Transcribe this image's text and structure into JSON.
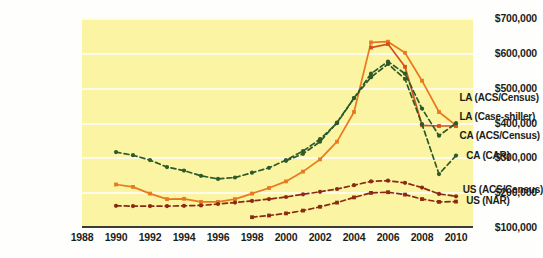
{
  "chart_data": {
    "type": "line",
    "title": "",
    "xlabel": "",
    "ylabel": "",
    "xlim": [
      1988,
      2011
    ],
    "ylim": [
      100000,
      700000
    ],
    "grid": true,
    "legend_position": "inline-right",
    "x_ticks": [
      "1988",
      "1990",
      "1992",
      "1994",
      "1996",
      "1998",
      "2000",
      "2002",
      "2004",
      "2006",
      "2008",
      "2010"
    ],
    "y_ticks": [
      "$100,000",
      "$200,000",
      "$300,000",
      "$400,000",
      "$500,000",
      "$600,000",
      "$700,000"
    ],
    "y_tick_values": [
      100000,
      200000,
      300000,
      400000,
      500000,
      600000,
      700000
    ],
    "plot_background": "#faf4a3",
    "gridline_color": "#fdfcef",
    "axis_color": "#3b3b35",
    "series": [
      {
        "name": "LA (ACS/Census)",
        "color": "#e8791e",
        "style": "solid",
        "marker": "square",
        "x": [
          1990,
          1991,
          1992,
          1993,
          1994,
          1995,
          1996,
          1997,
          1998,
          1999,
          2000,
          2001,
          2002,
          2003,
          2004,
          2005,
          2006,
          2007,
          2008,
          2009,
          2010
        ],
        "y": [
          222000,
          215000,
          196000,
          180000,
          181000,
          172000,
          172000,
          180000,
          196000,
          212000,
          231000,
          259000,
          294000,
          345000,
          430000,
          630000,
          632000,
          600000,
          520000,
          430000,
          392000
        ]
      },
      {
        "name": "LA (Case-shiller)",
        "color": "#d4511a",
        "style": "solid",
        "marker": "square",
        "x": [
          2005,
          2006,
          2007,
          2008,
          2009,
          2010
        ],
        "y": [
          615000,
          625000,
          560000,
          392000,
          390000,
          390000
        ]
      },
      {
        "name": "CA (ACS/Census)",
        "color": "#2d5a2a",
        "style": "dashed",
        "marker": "diamond",
        "x": [
          1990,
          1991,
          1992,
          1993,
          1994,
          1995,
          1996,
          1997,
          1998,
          1999,
          2000,
          2001,
          2002,
          2003,
          2004,
          2005,
          2006,
          2007,
          2008,
          2009,
          2010
        ],
        "y": [
          315000,
          306000,
          292000,
          272000,
          262000,
          247000,
          238000,
          242000,
          256000,
          270000,
          292000,
          318000,
          352000,
          398000,
          470000,
          540000,
          575000,
          540000,
          440000,
          362000,
          398000
        ]
      },
      {
        "name": "CA (CAR)",
        "color": "#2d5a2a",
        "style": "dashed",
        "marker": "diamond",
        "x": [
          2000,
          2001,
          2002,
          2003,
          2004,
          2005,
          2006,
          2007,
          2008,
          2009,
          2010
        ],
        "y": [
          290000,
          310000,
          345000,
          400000,
          470000,
          530000,
          568000,
          525000,
          395000,
          252000,
          305000
        ]
      },
      {
        "name": "US (ACS/Census)",
        "color": "#8a2a12",
        "style": "dashed",
        "marker": "diamond",
        "x": [
          1990,
          1991,
          1992,
          1993,
          1994,
          1995,
          1996,
          1997,
          1998,
          1999,
          2000,
          2001,
          2002,
          2003,
          2004,
          2005,
          2006,
          2007,
          2008,
          2009,
          2010
        ],
        "y": [
          161000,
          160000,
          160000,
          160000,
          161000,
          162000,
          166000,
          170000,
          175000,
          180000,
          186000,
          194000,
          201000,
          209000,
          220000,
          231000,
          233000,
          227000,
          213000,
          195000,
          188000
        ]
      },
      {
        "name": "US (NAR)",
        "color": "#8a2a12",
        "style": "dashed",
        "marker": "square",
        "x": [
          1998,
          1999,
          2000,
          2001,
          2002,
          2003,
          2004,
          2005,
          2006,
          2007,
          2008,
          2009,
          2010
        ],
        "y": [
          128000,
          133000,
          139000,
          147000,
          158000,
          170000,
          185000,
          198000,
          200000,
          193000,
          180000,
          172000,
          173000
        ]
      }
    ],
    "annotations": [
      {
        "text": "LA (ACS/Census)",
        "x": 2010.2,
        "y": 470000
      },
      {
        "text": "LA (Case-shiller)",
        "x": 2010.2,
        "y": 415000
      },
      {
        "text": "CA (ACS/Census)",
        "x": 2010.2,
        "y": 360000
      },
      {
        "text": "CA (CAR)",
        "x": 2010.6,
        "y": 305000
      },
      {
        "text": "US (ACS/Census)",
        "x": 2010.4,
        "y": 207000
      },
      {
        "text": "US (NAR)",
        "x": 2010.6,
        "y": 176000
      }
    ]
  }
}
